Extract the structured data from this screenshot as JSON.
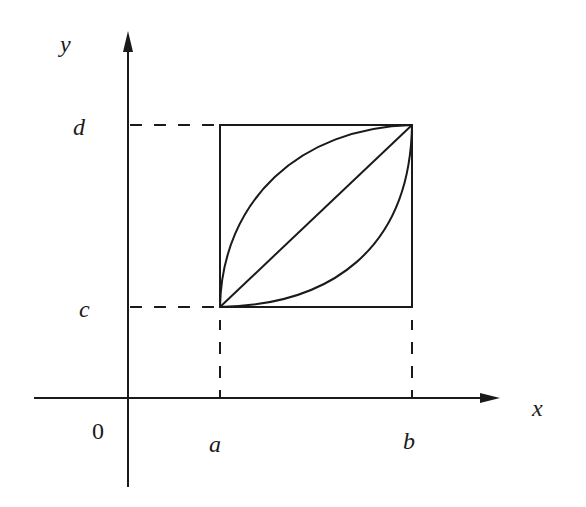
{
  "diagram": {
    "axes": {
      "x_label": "x",
      "y_label": "y",
      "origin_label": "0"
    },
    "ticks": {
      "x": [
        "a",
        "b"
      ],
      "y": [
        "c",
        "d"
      ]
    },
    "region": {
      "description": "Rectangle [a,b] x [c,d] with three curves from (a,c) to (b,d): a concave arc above, a straight diagonal, and a convex arc below",
      "curves": [
        "upper-concave-arc",
        "diagonal-line",
        "lower-convex-arc"
      ]
    },
    "colors": {
      "stroke": "#1a1a1a",
      "background": "#ffffff"
    }
  }
}
